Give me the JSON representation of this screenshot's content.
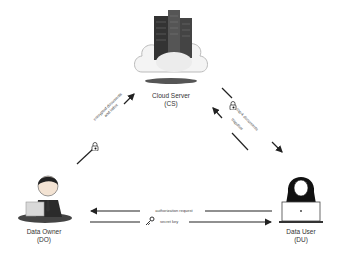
{
  "diagram": {
    "nodes": {
      "cloud_server": {
        "name": "Cloud Server",
        "abbr": "(CS)",
        "icon": "cloud-server-icon"
      },
      "data_owner": {
        "name": "Data Owner",
        "abbr": "(DO)",
        "icon": "businessman-laptop-icon"
      },
      "data_user": {
        "name": "Data User",
        "abbr": "(DU)",
        "icon": "woman-laptop-icon"
      }
    },
    "edges": {
      "do_to_cs": {
        "label_line1": "encrypted documents",
        "label_line2": "and index",
        "icon": "lock-icon",
        "from": "DO",
        "to": "CS"
      },
      "cs_to_du": {
        "label": "top-k documents",
        "icon": "lock-icon",
        "from": "CS",
        "to": "DU"
      },
      "du_to_cs": {
        "label": "trapdoor",
        "from": "DU",
        "to": "CS"
      },
      "du_to_do": {
        "label": "authorization request",
        "from": "DU",
        "to": "DO"
      },
      "do_to_du": {
        "label": "secret key",
        "icon": "key-icon",
        "from": "DO",
        "to": "DU"
      }
    },
    "colors": {
      "line": "#222222",
      "text": "#333333",
      "cloud": "#f4f4f4",
      "shadow": "#555555"
    }
  }
}
